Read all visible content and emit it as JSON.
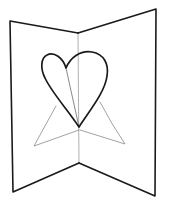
{
  "figure": {
    "colors": {
      "background": "#ffffff",
      "outline": "#1a1a1a",
      "fold_lines": "#8a8a8a"
    },
    "card": {
      "left_panel": [
        [
          10,
          21
        ],
        [
          78,
          33
        ],
        [
          79,
          163
        ],
        [
          13,
          192
        ]
      ],
      "right_panel": [
        [
          78,
          33
        ],
        [
          156,
          9
        ],
        [
          155,
          196
        ],
        [
          79,
          163
        ]
      ],
      "center_fold": [
        [
          78,
          33
        ],
        [
          79,
          163
        ]
      ]
    },
    "heart": {
      "bottom_point": [
        79,
        127
      ],
      "center_dip": [
        66,
        68
      ],
      "inner_fold_line": [
        [
          66,
          68
        ],
        [
          79,
          127
        ]
      ]
    },
    "support_triangles": {
      "left": [
        [
          56,
          106
        ],
        [
          34,
          146
        ],
        [
          79,
          130
        ]
      ],
      "right": [
        [
          100,
          102
        ],
        [
          125,
          144
        ],
        [
          80,
          130
        ]
      ]
    }
  }
}
